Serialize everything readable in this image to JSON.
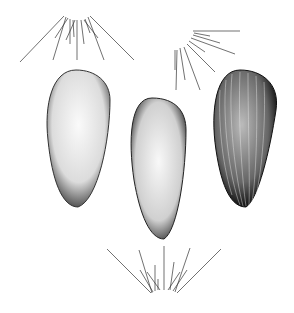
{
  "figure": {
    "background": "#ffffff",
    "ink": "#222222",
    "items": [
      {
        "name": "pappus-top-left"
      },
      {
        "name": "pappus-top-right"
      },
      {
        "name": "seed-left"
      },
      {
        "name": "seed-center"
      },
      {
        "name": "seed-right"
      },
      {
        "name": "pappus-bottom"
      }
    ]
  }
}
